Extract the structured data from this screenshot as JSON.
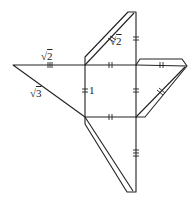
{
  "diagram": {
    "type": "geometry-net",
    "stroke_color": "#222222",
    "labels": {
      "top_edge_left": {
        "radical": "√",
        "value": "2"
      },
      "hypotenuse_left": {
        "radical": "√",
        "value": "3"
      },
      "square_side": "1",
      "top_flap_edge": {
        "radical": "√",
        "value": "2"
      }
    },
    "tick_marks": {
      "square_sides": "double",
      "left_top_edge": "triple",
      "top_flap_vertical": "double",
      "right_flap_edges": "double",
      "bottom_flap_vertical": "triple"
    }
  }
}
